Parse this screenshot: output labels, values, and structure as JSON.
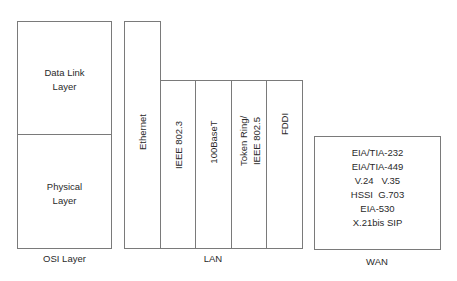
{
  "osi": {
    "caption": "OSI Layer",
    "layers": [
      {
        "line1": "Data Link",
        "line2": "Layer"
      },
      {
        "line1": "Physical",
        "line2": "Layer"
      }
    ]
  },
  "lan": {
    "caption": "LAN",
    "columns": [
      {
        "line1": "Ethernet",
        "line2": ""
      },
      {
        "line1": "IEEE 802.3",
        "line2": ""
      },
      {
        "line1": "100BaseT",
        "line2": ""
      },
      {
        "line1": "Token Ring/",
        "line2": "IEEE 802.5"
      },
      {
        "line1": "FDDI",
        "line2": ""
      }
    ]
  },
  "wan": {
    "caption": "WAN",
    "lines": [
      "EIA/TIA-232",
      "EIA/TIA-449",
      "V.24   V.35",
      "HSSI  G.703",
      "EIA-530",
      "X.21bis SIP"
    ]
  }
}
